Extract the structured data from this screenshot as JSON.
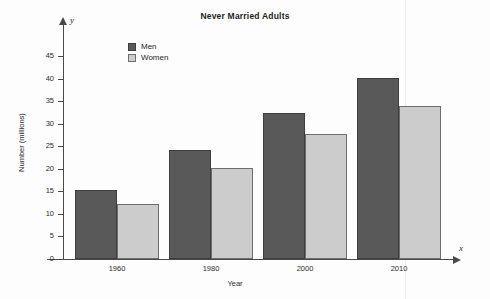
{
  "chart_data": {
    "type": "bar",
    "title": "Never Married Adults",
    "xlabel": "Year",
    "ylabel": "Number (millions)",
    "categories": [
      "1960",
      "1980",
      "2000",
      "2010"
    ],
    "series": [
      {
        "name": "Men",
        "color": "#595959",
        "values": [
          15.3,
          24.2,
          32.3,
          40.1
        ]
      },
      {
        "name": "Women",
        "color": "#cccccc",
        "values": [
          12.3,
          20.2,
          27.8,
          34.0
        ]
      }
    ],
    "ylim": [
      0,
      45
    ],
    "ytick_labels": [
      "0",
      "5",
      "10",
      "15",
      "20",
      "25",
      "30",
      "35",
      "40",
      "45"
    ],
    "ytick_values": [
      0,
      5,
      10,
      15,
      20,
      25,
      30,
      35,
      40,
      45
    ],
    "grid": false,
    "legend_position": "top-left-inside",
    "axis_letter_y": "y",
    "axis_letter_x": "x"
  }
}
